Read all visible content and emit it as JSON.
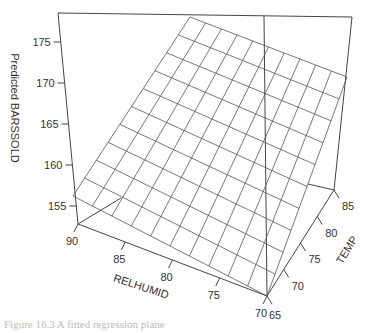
{
  "chart_data": {
    "type": "surface",
    "title": "",
    "zlabel": "Predicted BARSSOLD",
    "xlabel": "RELHUMID",
    "ylabel": "TEMP",
    "z_ticks": [
      155,
      160,
      165,
      170,
      175
    ],
    "x_ticks": [
      90,
      85,
      80,
      75,
      70
    ],
    "y_ticks": [
      65,
      70,
      75,
      80,
      85
    ],
    "x_range": [
      70,
      90
    ],
    "y_range": [
      65,
      85
    ],
    "z_range": [
      152,
      178
    ],
    "grid_lines_per_axis": 10,
    "surface_corners": [
      {
        "RELHUMID": 90,
        "TEMP": 85,
        "z": 177
      },
      {
        "RELHUMID": 70,
        "TEMP": 85,
        "z": 168
      },
      {
        "RELHUMID": 70,
        "TEMP": 65,
        "z": 153
      },
      {
        "RELHUMID": 90,
        "TEMP": 65,
        "z": 161
      }
    ]
  },
  "labels": {
    "zlabel": "Predicted BARSSOLD",
    "xlabel": "RELHUMID",
    "ylabel": "TEMP",
    "z_ticks": [
      "155",
      "160",
      "165",
      "170",
      "175"
    ],
    "x_ticks": [
      "90",
      "85",
      "80",
      "75",
      "70"
    ],
    "y_ticks": [
      "65",
      "70",
      "75",
      "80",
      "85"
    ],
    "caption": "Figure 16.3   A fitted regression plane"
  }
}
